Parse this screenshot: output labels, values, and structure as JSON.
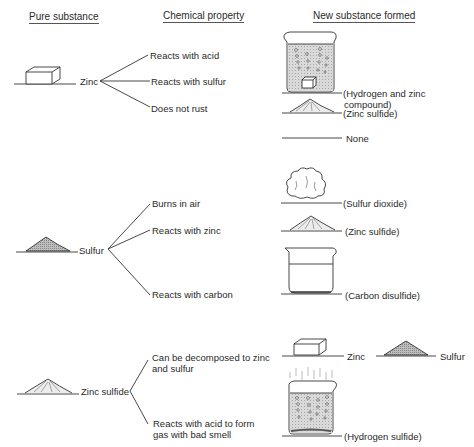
{
  "headers": {
    "pure_substance": "Pure substance",
    "chemical_property": "Chemical property",
    "new_substance": "New substance formed"
  },
  "groups": [
    {
      "substance": "Zinc",
      "icon": "zinc-block",
      "properties": [
        {
          "label": "Reacts with acid",
          "result": "(Hydrogen and zinc",
          "result_line2": "compound)",
          "result_icon": "bubbling-beaker-with-zinc"
        },
        {
          "label": "Reacts with sulfur",
          "result": "(Zinc sulfide)",
          "result_icon": "powder-pile"
        },
        {
          "label": "Does not rust",
          "result": "None",
          "result_icon": "none"
        }
      ]
    },
    {
      "substance": "Sulfur",
      "icon": "powder-pile",
      "properties": [
        {
          "label": "Burns in air",
          "result": "(Sulfur dioxide)",
          "result_icon": "gas-cloud"
        },
        {
          "label": "Reacts with zinc",
          "result": "(Zinc sulfide)",
          "result_icon": "powder-pile"
        },
        {
          "label": "Reacts with carbon",
          "result": "(Carbon disulfide)",
          "result_icon": "liquid-beaker"
        }
      ]
    },
    {
      "substance": "Zinc sulfide",
      "icon": "powder-pile",
      "properties": [
        {
          "label": "Can be decomposed to zinc",
          "label_line2": "and sulfur",
          "result": "Zinc",
          "result_b": "Sulfur",
          "result_icon": "zinc-block-and-powder-pile"
        },
        {
          "label": "Reacts with acid to form",
          "label_line2": "gas with bad smell",
          "result": "(Hydrogen sulfide)",
          "result_icon": "fuming-bubbling-beaker"
        }
      ]
    }
  ]
}
